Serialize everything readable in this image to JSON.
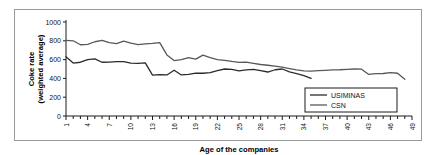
{
  "figure": {
    "border_color": "#9a9a9a",
    "background": "#ffffff"
  },
  "chart_data": {
    "type": "line",
    "title": "",
    "xlabel": "Age of the companies",
    "ylabel": "Coke rate (weighted average)",
    "ylabel_line1": "Coke rate",
    "ylabel_line2": "(weighted average)",
    "xlim": [
      1,
      49
    ],
    "ylim": [
      0,
      1000
    ],
    "ytick_labels": [
      "0",
      "200",
      "400",
      "600",
      "800",
      "1000"
    ],
    "yticks": [
      0,
      200,
      400,
      600,
      800,
      1000
    ],
    "xticks": [
      1,
      4,
      7,
      10,
      13,
      16,
      19,
      22,
      25,
      28,
      31,
      34,
      37,
      40,
      43,
      46,
      49
    ],
    "xtick_labels": [
      "1",
      "4",
      "7",
      "10",
      "13",
      "16",
      "19",
      "22",
      "25",
      "28",
      "31",
      "34",
      "37",
      "40",
      "43",
      "46",
      "49"
    ],
    "xtick_minor_step": 1,
    "grid": false,
    "legend_position": "lower right",
    "series": [
      {
        "name": "USIMINAS",
        "color": "#2b2b2b",
        "width": 1.3,
        "x": [
          1,
          2,
          3,
          4,
          5,
          6,
          7,
          8,
          9,
          10,
          11,
          12,
          13,
          14,
          15,
          16,
          17,
          18,
          19,
          20,
          21,
          22,
          23,
          24,
          25,
          26,
          27,
          28,
          29,
          30,
          31,
          32,
          33,
          34,
          35
        ],
        "values": [
          630,
          563,
          572,
          600,
          608,
          572,
          574,
          578,
          578,
          562,
          560,
          565,
          435,
          440,
          437,
          487,
          437,
          442,
          455,
          455,
          462,
          483,
          500,
          495,
          480,
          490,
          495,
          483,
          468,
          492,
          500,
          470,
          452,
          430,
          400
        ]
      },
      {
        "name": "CSN",
        "color": "#585858",
        "width": 1.3,
        "x": [
          1,
          2,
          3,
          4,
          5,
          6,
          7,
          8,
          9,
          10,
          11,
          12,
          13,
          14,
          15,
          16,
          17,
          18,
          19,
          20,
          21,
          22,
          23,
          24,
          25,
          26,
          27,
          28,
          29,
          30,
          31,
          32,
          33,
          34,
          35,
          36,
          37,
          38,
          39,
          40,
          41,
          42,
          43,
          44,
          45,
          46,
          47,
          48
        ],
        "values": [
          805,
          800,
          758,
          762,
          790,
          805,
          780,
          770,
          797,
          775,
          760,
          768,
          772,
          780,
          650,
          590,
          600,
          620,
          605,
          648,
          620,
          600,
          592,
          580,
          570,
          572,
          560,
          548,
          540,
          530,
          520,
          505,
          490,
          480,
          478,
          482,
          486,
          490,
          492,
          496,
          500,
          498,
          442,
          450,
          452,
          462,
          455,
          390
        ]
      }
    ]
  },
  "legend": {
    "items": [
      {
        "label": "USIMINAS",
        "color": "#2b2b2b"
      },
      {
        "label": "CSN",
        "color": "#585858"
      }
    ]
  }
}
